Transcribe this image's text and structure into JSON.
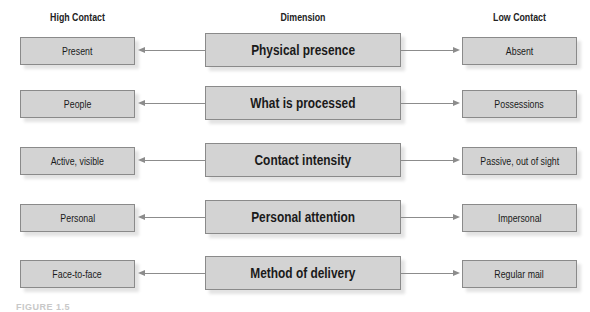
{
  "headers": {
    "high": "High Contact",
    "dimension": "Dimension",
    "low": "Low Contact"
  },
  "rows": [
    {
      "high": "Present",
      "dimension": "Physical presence",
      "low": "Absent"
    },
    {
      "high": "People",
      "dimension": "What is processed",
      "low": "Possessions"
    },
    {
      "high": "Active, visible",
      "dimension": "Contact intensity",
      "low": "Passive, out of sight"
    },
    {
      "high": "Personal",
      "dimension": "Personal attention",
      "low": "Impersonal"
    },
    {
      "high": "Face-to-face",
      "dimension": "Method of delivery",
      "low": "Regular mail"
    }
  ],
  "caption": "FIGURE 1.5",
  "colors": {
    "box_fill": "#d3d3d3",
    "box_border": "#8a8a8a",
    "arrow": "#8c8c8c"
  }
}
